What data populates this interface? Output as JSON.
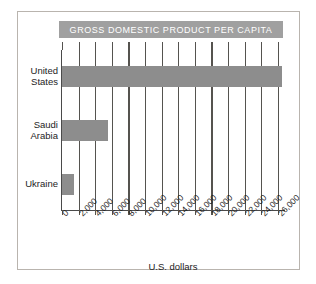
{
  "chart_data": {
    "type": "bar",
    "orientation": "horizontal",
    "title": "GROSS DOMESTIC PRODUCT PER CAPITA",
    "xlabel": "U.S. dollars",
    "ylabel": "",
    "categories": [
      "United States",
      "Saudi Arabia",
      "Ukraine"
    ],
    "values": [
      26500,
      5600,
      1400
    ],
    "xlim": [
      0,
      27000
    ],
    "xticks": [
      0,
      2000,
      4000,
      6000,
      8000,
      10000,
      12000,
      14000,
      16000,
      18000,
      20000,
      22000,
      24000,
      26000
    ],
    "xtick_labels": [
      "0",
      "2,000",
      "4,000",
      "6,000",
      "8,000",
      "10,000",
      "12,000",
      "14,000",
      "16,000",
      "18,000",
      "20,000",
      "22,000",
      "24,000",
      "26,000"
    ],
    "grid": true,
    "grid_axis": "x",
    "legend": false,
    "bar_color": "#8d8d8d",
    "title_banner_color": "#a0a0a0",
    "title_text_color": "#ffffff",
    "axis_color": "#55534f",
    "frame_border_color": "#b9b4ae",
    "background": "#ffffff"
  }
}
